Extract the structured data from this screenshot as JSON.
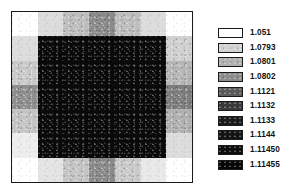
{
  "figure": {
    "title": "",
    "background_color": "#ffffff",
    "frame_color": "#1a1a1a"
  },
  "legend": {
    "position": "right",
    "entries": [
      {
        "label": "1.051",
        "color": "#ffffff"
      },
      {
        "label": "1.0793",
        "color": "#d2d2d2"
      },
      {
        "label": "1.0801",
        "color": "#b0b0b0"
      },
      {
        "label": "1.0802",
        "color": "#8e8e8e"
      },
      {
        "label": "1.1121",
        "color": "#5c5c5c"
      },
      {
        "label": "1.1132",
        "color": "#3a3a3a"
      },
      {
        "label": "1.1133",
        "color": "#1c1c1c"
      },
      {
        "label": "1.1144",
        "color": "#141414"
      },
      {
        "label": "1.11450",
        "color": "#0d0d0d"
      },
      {
        "label": "1.11455",
        "color": "#060606"
      }
    ]
  },
  "chart_data": {
    "type": "heatmap",
    "title": "",
    "xlabel": "",
    "ylabel": "",
    "grid": false,
    "legend_position": "right",
    "axis_ticks_visible": false,
    "colorbar_levels": [
      1.051,
      1.0793,
      1.0801,
      1.0802,
      1.1121,
      1.1132,
      1.1133,
      1.1144,
      1.1145,
      1.11455
    ],
    "level_colors": [
      "#ffffff",
      "#d2d2d2",
      "#b0b0b0",
      "#8e8e8e",
      "#5c5c5c",
      "#3a3a3a",
      "#1c1c1c",
      "#141414",
      "#0d0d0d",
      "#060606"
    ],
    "rows": 7,
    "cols": 7,
    "values": [
      [
        1.051,
        1.0793,
        1.0801,
        1.1121,
        1.0801,
        1.0793,
        1.051
      ],
      [
        1.0793,
        1.11455,
        1.11455,
        1.11455,
        1.11455,
        1.11455,
        1.0793
      ],
      [
        1.0801,
        1.11455,
        1.11455,
        1.11455,
        1.11455,
        1.11455,
        1.0802
      ],
      [
        1.1121,
        1.11455,
        1.11455,
        1.11455,
        1.11455,
        1.11455,
        1.1121
      ],
      [
        1.0801,
        1.11455,
        1.11455,
        1.11455,
        1.11455,
        1.11455,
        1.0802
      ],
      [
        1.0793,
        1.11455,
        1.11455,
        1.11455,
        1.11455,
        1.11455,
        1.0793
      ],
      [
        1.051,
        1.0793,
        1.0801,
        1.1121,
        1.0801,
        1.0793,
        1.051
      ]
    ],
    "cell_colors": [
      [
        "#ffffff",
        "#dcdcdc",
        "#bdbdbd",
        "#8a8a8a",
        "#bdbdbd",
        "#dcdcdc",
        "#ffffff"
      ],
      [
        "#dcdcdc",
        "#0a0a0a",
        "#0a0a0a",
        "#0a0a0a",
        "#0a0a0a",
        "#0a0a0a",
        "#cfcfcf"
      ],
      [
        "#c9c9c9",
        "#0a0a0a",
        "#0a0a0a",
        "#0a0a0a",
        "#0a0a0a",
        "#0a0a0a",
        "#b5b5b5"
      ],
      [
        "#8e8e8e",
        "#0a0a0a",
        "#0a0a0a",
        "#0a0a0a",
        "#0a0a0a",
        "#0a0a0a",
        "#7d7d7d"
      ],
      [
        "#c4c4c4",
        "#0a0a0a",
        "#0a0a0a",
        "#0a0a0a",
        "#0a0a0a",
        "#0a0a0a",
        "#b0b0b0"
      ],
      [
        "#ededed",
        "#0a0a0a",
        "#0a0a0a",
        "#0a0a0a",
        "#0a0a0a",
        "#0a0a0a",
        "#dcdcdc"
      ],
      [
        "#ffffff",
        "#e4e4e4",
        "#c4c4c4",
        "#8a8a8a",
        "#c9c9c9",
        "#e9e9e9",
        "#ffffff"
      ]
    ]
  }
}
